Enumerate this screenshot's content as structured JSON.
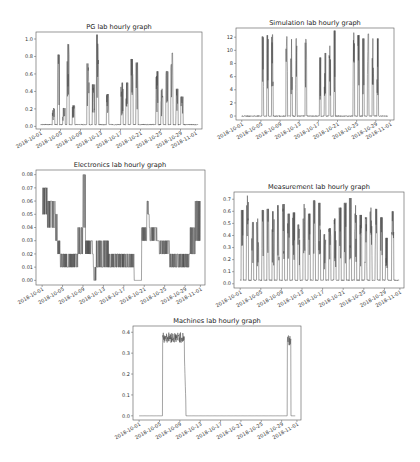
{
  "chart_data": [
    {
      "id": "pg",
      "type": "line",
      "title": "PG lab hourly graph",
      "xlabel": "",
      "ylabel": "",
      "x_tick_labels": [
        "2018-10-01",
        "2018-10-05",
        "2018-10-09",
        "2018-10-13",
        "2018-10-17",
        "2018-10-21",
        "2018-10-25",
        "2018-10-29",
        "2018-11-01"
      ],
      "y_ticks": [
        0.0,
        0.2,
        0.4,
        0.6,
        0.8,
        1.0
      ],
      "y_tick_labels": [
        "0.0",
        "0.2",
        "0.4",
        "0.6",
        "0.8",
        "1.0"
      ],
      "ylim": [
        -0.03,
        1.08
      ],
      "xlim_days": [
        -0.9,
        32.3
      ],
      "grid": false,
      "frame_px": {
        "left": 36,
        "right": 202,
        "top": 32,
        "bottom": 129
      },
      "baseline": 0.02,
      "x_start_day": 0.0,
      "x_end_day": 31.5,
      "spikes": [
        {
          "day": 2.6,
          "peak": 0.21,
          "width": 0.5
        },
        {
          "day": 3.6,
          "peak": 0.82,
          "width": 0.45
        },
        {
          "day": 4.7,
          "peak": 0.21,
          "width": 0.5
        },
        {
          "day": 5.5,
          "peak": 0.94,
          "width": 0.45
        },
        {
          "day": 6.6,
          "peak": 0.24,
          "width": 0.5
        },
        {
          "day": 9.5,
          "peak": 0.72,
          "width": 0.45
        },
        {
          "day": 10.6,
          "peak": 0.48,
          "width": 0.5
        },
        {
          "day": 11.4,
          "peak": 1.05,
          "width": 0.45
        },
        {
          "day": 13.4,
          "peak": 0.37,
          "width": 0.45
        },
        {
          "day": 16.3,
          "peak": 0.5,
          "width": 0.45
        },
        {
          "day": 17.3,
          "peak": 0.5,
          "width": 0.45
        },
        {
          "day": 18.3,
          "peak": 0.77,
          "width": 0.45
        },
        {
          "day": 19.3,
          "peak": 0.73,
          "width": 0.45
        },
        {
          "day": 23.3,
          "peak": 0.63,
          "width": 0.45
        },
        {
          "day": 24.3,
          "peak": 0.43,
          "width": 0.45
        },
        {
          "day": 25.3,
          "peak": 0.63,
          "width": 0.45
        },
        {
          "day": 26.3,
          "peak": 0.84,
          "width": 0.45
        },
        {
          "day": 27.3,
          "peak": 0.43,
          "width": 0.45
        },
        {
          "day": 28.3,
          "peak": 0.34,
          "width": 0.45
        }
      ]
    },
    {
      "id": "sim",
      "type": "line",
      "title": "Simulation lab hourly graph",
      "xlabel": "",
      "ylabel": "",
      "x_tick_labels": [
        "2018-10-01",
        "2018-10-05",
        "2018-10-09",
        "2018-10-13",
        "2018-10-17",
        "2018-10-21",
        "2018-10-25",
        "2018-10-29",
        "2018-11-01"
      ],
      "y_ticks": [
        0,
        2,
        4,
        6,
        8,
        10,
        12
      ],
      "y_tick_labels": [
        "0",
        "2",
        "4",
        "6",
        "8",
        "10",
        "12"
      ],
      "ylim": [
        -0.6,
        13.4
      ],
      "xlim_days": [
        -1.2,
        31.8
      ],
      "grid": false,
      "frame_px": {
        "left": 236,
        "right": 394,
        "top": 28,
        "bottom": 120
      },
      "baseline": 0.0,
      "x_start_day": 0.0,
      "x_end_day": 30.5,
      "spikes": [
        {
          "day": 4.4,
          "peak": 12.1,
          "width": 0.35
        },
        {
          "day": 5.4,
          "peak": 12.3,
          "width": 0.35
        },
        {
          "day": 6.4,
          "peak": 12.4,
          "width": 0.35
        },
        {
          "day": 9.4,
          "peak": 12.1,
          "width": 0.35
        },
        {
          "day": 10.4,
          "peak": 11.7,
          "width": 0.35
        },
        {
          "day": 11.4,
          "peak": 11.8,
          "width": 0.35
        },
        {
          "day": 13.4,
          "peak": 11.7,
          "width": 0.35
        },
        {
          "day": 16.4,
          "peak": 8.9,
          "width": 0.35
        },
        {
          "day": 17.4,
          "peak": 9.6,
          "width": 0.35
        },
        {
          "day": 18.4,
          "peak": 10.7,
          "width": 0.35
        },
        {
          "day": 19.4,
          "peak": 13.0,
          "width": 0.35
        },
        {
          "day": 23.4,
          "peak": 12.7,
          "width": 0.35
        },
        {
          "day": 24.4,
          "peak": 12.3,
          "width": 0.35
        },
        {
          "day": 25.4,
          "peak": 11.8,
          "width": 0.35
        },
        {
          "day": 26.4,
          "peak": 12.5,
          "width": 0.35
        },
        {
          "day": 27.4,
          "peak": 11.8,
          "width": 0.35
        },
        {
          "day": 28.4,
          "peak": 11.8,
          "width": 0.35
        }
      ]
    },
    {
      "id": "elec",
      "type": "line",
      "title": "Electronics lab hourly graph",
      "xlabel": "",
      "ylabel": "",
      "x_tick_labels": [
        "2018-10-01",
        "2018-10-05",
        "2018-10-09",
        "2018-10-13",
        "2018-10-17",
        "2018-10-21",
        "2018-10-25",
        "2018-10-29",
        "2018-11-01"
      ],
      "y_ticks": [
        0.0,
        0.01,
        0.02,
        0.03,
        0.04,
        0.05,
        0.06,
        0.07,
        0.08
      ],
      "y_tick_labels": [
        "0.00",
        "0.01",
        "0.02",
        "0.03",
        "0.04",
        "0.05",
        "0.06",
        "0.07",
        "0.08"
      ],
      "ylim": [
        -0.0035,
        0.0835
      ],
      "xlim_days": [
        -1.2,
        31.9
      ],
      "grid": false,
      "frame_px": {
        "left": 36,
        "right": 205,
        "top": 170,
        "bottom": 285
      },
      "levels": [
        {
          "from": 0.0,
          "to": 1.0,
          "lo": 0.05,
          "hi": 0.07
        },
        {
          "from": 1.0,
          "to": 2.5,
          "lo": 0.04,
          "hi": 0.06
        },
        {
          "from": 2.5,
          "to": 3.0,
          "lo": 0.03,
          "hi": 0.05
        },
        {
          "from": 3.0,
          "to": 3.5,
          "lo": 0.02,
          "hi": 0.03
        },
        {
          "from": 3.5,
          "to": 7.0,
          "lo": 0.01,
          "hi": 0.02
        },
        {
          "from": 7.0,
          "to": 8.0,
          "lo": 0.02,
          "hi": 0.04
        },
        {
          "from": 8.0,
          "to": 8.5,
          "lo": 0.04,
          "hi": 0.08
        },
        {
          "from": 8.5,
          "to": 10.0,
          "lo": 0.02,
          "hi": 0.03
        },
        {
          "from": 10.0,
          "to": 10.6,
          "lo": 0.0,
          "hi": 0.01
        },
        {
          "from": 10.6,
          "to": 13.0,
          "lo": 0.01,
          "hi": 0.03
        },
        {
          "from": 13.0,
          "to": 18.0,
          "lo": 0.01,
          "hi": 0.02
        },
        {
          "from": 18.0,
          "to": 19.5,
          "lo": 0.0,
          "hi": 0.0
        },
        {
          "from": 19.5,
          "to": 20.5,
          "lo": 0.03,
          "hi": 0.04
        },
        {
          "from": 20.5,
          "to": 21.0,
          "lo": 0.05,
          "hi": 0.06
        },
        {
          "from": 21.0,
          "to": 22.5,
          "lo": 0.03,
          "hi": 0.04
        },
        {
          "from": 22.5,
          "to": 25.0,
          "lo": 0.02,
          "hi": 0.03
        },
        {
          "from": 25.0,
          "to": 29.0,
          "lo": 0.01,
          "hi": 0.02
        },
        {
          "from": 29.0,
          "to": 30.0,
          "lo": 0.02,
          "hi": 0.04
        },
        {
          "from": 30.0,
          "to": 31.0,
          "lo": 0.03,
          "hi": 0.06
        }
      ]
    },
    {
      "id": "meas",
      "type": "line",
      "title": "Measurement lab hourly graph",
      "xlabel": "",
      "ylabel": "",
      "x_tick_labels": [
        "2018-10-01",
        "2018-10-05",
        "2018-10-09",
        "2018-10-13",
        "2018-10-17",
        "2018-10-21",
        "2018-10-25",
        "2018-10-29",
        "2018-11-01"
      ],
      "y_ticks": [
        0.0,
        0.1,
        0.2,
        0.3,
        0.4,
        0.5,
        0.6,
        0.7
      ],
      "y_tick_labels": [
        "0.0",
        "0.1",
        "0.2",
        "0.3",
        "0.4",
        "0.5",
        "0.6",
        "0.7"
      ],
      "ylim": [
        -0.035,
        0.76
      ],
      "xlim_days": [
        -1.2,
        31.8
      ],
      "grid": false,
      "frame_px": {
        "left": 234,
        "right": 404,
        "top": 192,
        "bottom": 288
      },
      "baseline": 0.03,
      "x_start_day": 0.0,
      "x_end_day": 30.8,
      "spikes": [
        {
          "day": 0.4,
          "peak": 0.61
        },
        {
          "day": 1.4,
          "peak": 0.73
        },
        {
          "day": 2.4,
          "peak": 0.51
        },
        {
          "day": 3.4,
          "peak": 0.54
        },
        {
          "day": 4.4,
          "peak": 0.61
        },
        {
          "day": 5.4,
          "peak": 0.62
        },
        {
          "day": 6.4,
          "peak": 0.6
        },
        {
          "day": 7.4,
          "peak": 0.65
        },
        {
          "day": 8.4,
          "peak": 0.66
        },
        {
          "day": 9.4,
          "peak": 0.58
        },
        {
          "day": 10.4,
          "peak": 0.59
        },
        {
          "day": 11.4,
          "peak": 0.49
        },
        {
          "day": 12.4,
          "peak": 0.66
        },
        {
          "day": 13.4,
          "peak": 0.58
        },
        {
          "day": 14.4,
          "peak": 0.69
        },
        {
          "day": 15.4,
          "peak": 0.67
        },
        {
          "day": 16.4,
          "peak": 0.41
        },
        {
          "day": 17.4,
          "peak": 0.46
        },
        {
          "day": 18.4,
          "peak": 0.54
        },
        {
          "day": 19.4,
          "peak": 0.63
        },
        {
          "day": 20.4,
          "peak": 0.67
        },
        {
          "day": 21.4,
          "peak": 0.71
        },
        {
          "day": 22.4,
          "peak": 0.65
        },
        {
          "day": 23.4,
          "peak": 0.57
        },
        {
          "day": 24.4,
          "peak": 0.55
        },
        {
          "day": 25.4,
          "peak": 0.63
        },
        {
          "day": 26.4,
          "peak": 0.62
        },
        {
          "day": 27.4,
          "peak": 0.55
        },
        {
          "day": 28.4,
          "peak": 0.38
        },
        {
          "day": 29.6,
          "peak": 0.6
        }
      ]
    },
    {
      "id": "mach",
      "type": "line",
      "title": "Machines lab hourly graph",
      "xlabel": "",
      "ylabel": "",
      "x_tick_labels": [
        "2018-10-01",
        "2018-10-05",
        "2018-10-09",
        "2018-10-13",
        "2018-10-17",
        "2018-10-21",
        "2018-10-25",
        "2018-10-29",
        "2018-11-01"
      ],
      "y_ticks": [
        0.0,
        0.1,
        0.2,
        0.3,
        0.4
      ],
      "y_tick_labels": [
        "0.0",
        "0.1",
        "0.2",
        "0.3",
        "0.4"
      ],
      "ylim": [
        -0.02,
        0.43
      ],
      "xlim_days": [
        -1.2,
        31.8
      ],
      "grid": false,
      "frame_px": {
        "left": 133,
        "right": 301,
        "top": 326,
        "bottom": 420
      },
      "baseline": 0.0,
      "x_start_day": 0.0,
      "x_end_day": 30.7,
      "blocks": [
        {
          "from": 4.6,
          "to": 8.9,
          "lo": 0.35,
          "hi": 0.4,
          "tail": 0.23
        },
        {
          "from": 29.1,
          "to": 29.8,
          "lo": 0.33,
          "hi": 0.4,
          "tail": 0.0
        }
      ]
    }
  ]
}
